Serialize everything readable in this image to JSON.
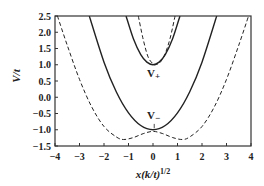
{
  "chart_data": {
    "type": "line",
    "title": "",
    "xlabel": "x(k/t)^1/2",
    "ylabel": "V/t",
    "xlim": [
      -4,
      4
    ],
    "ylim": [
      -1.5,
      2.5
    ],
    "xticks": [
      "-4",
      "-3",
      "-2",
      "-1",
      "0",
      "1",
      "2",
      "3",
      "4"
    ],
    "yticks": [
      "2.5",
      "2.0",
      "1.5",
      "1.0",
      "0.5",
      "0.0",
      "-0.5",
      "-1.0",
      "-1.5"
    ],
    "grid": false,
    "annotations": [
      {
        "text": "V+",
        "x": 0.0,
        "y": 0.75
      },
      {
        "text": "V−",
        "x": 0.0,
        "y": -0.6
      }
    ],
    "series": [
      {
        "name": "V+ (solid)",
        "style": "solid",
        "x": [
          -1.1,
          -0.8,
          -0.5,
          -0.25,
          0,
          0.25,
          0.5,
          0.8,
          1.1
        ],
        "values": [
          2.5,
          1.8,
          1.31,
          1.08,
          1.0,
          1.08,
          1.31,
          1.8,
          2.5
        ]
      },
      {
        "name": "V+ (dashed)",
        "style": "dashed",
        "x": [
          -0.6,
          -0.4,
          -0.2,
          0,
          0.1,
          0.3,
          0.5,
          0.7,
          0.9
        ],
        "values": [
          2.5,
          1.78,
          1.24,
          1.03,
          1.0,
          1.08,
          1.35,
          1.82,
          2.5
        ]
      },
      {
        "name": "V− (solid)",
        "style": "solid",
        "x": [
          -2.6,
          -2,
          -1.5,
          -1,
          -0.5,
          0,
          0.5,
          1,
          1.5,
          2,
          2.6
        ],
        "values": [
          2.5,
          1.08,
          0.17,
          -0.48,
          -0.87,
          -1.0,
          -0.87,
          -0.48,
          0.17,
          1.08,
          2.5
        ]
      },
      {
        "name": "V− (dashed)",
        "style": "dashed",
        "x": [
          -3.9,
          -3.5,
          -3,
          -2.5,
          -2,
          -1.5,
          -1.2,
          -0.8,
          -0.4,
          0,
          0.4,
          0.8,
          1.2,
          1.5,
          2,
          2.5,
          3,
          3.5,
          3.9
        ],
        "values": [
          2.5,
          1.6,
          0.55,
          -0.3,
          -0.9,
          -1.22,
          -1.3,
          -1.24,
          -1.12,
          -1.05,
          -1.12,
          -1.24,
          -1.3,
          -1.22,
          -0.9,
          -0.3,
          0.55,
          1.6,
          2.5
        ]
      }
    ]
  }
}
